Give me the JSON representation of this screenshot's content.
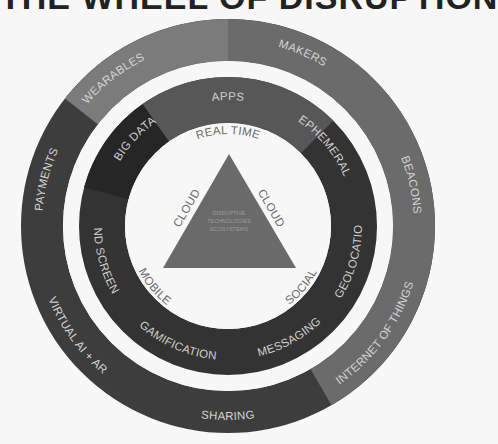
{
  "title": "THE WHEEL OF DISRUPTION",
  "colors": {
    "background": "#f7f7f7",
    "outer_light": "#7b7b7b",
    "outer_medium": "#6b6b6b",
    "outer_dark": "#3d3d3d",
    "inner_dark": "#333333",
    "inner_darker": "#262626",
    "inner_light": "#575757",
    "triangle": "#6a6a6a",
    "label_text": "#d4d4d4",
    "center_text": "#6a6a6a"
  },
  "outer_ring": {
    "segments": [
      {
        "label": "WEARABLES",
        "color": "#7b7b7b"
      },
      {
        "label": "MAKERS",
        "color": "#6b6b6b"
      },
      {
        "label": "BEACONS",
        "color": "#6b6b6b"
      },
      {
        "label": "INTERNET OF THINGS",
        "color": "#686868"
      },
      {
        "label": "SHARING",
        "color": "#3d3d3d"
      },
      {
        "label": "VIRTUAL AI + AR",
        "color": "#3d3d3d"
      },
      {
        "label": "PAYMENTS",
        "color": "#3d3d3d"
      }
    ]
  },
  "inner_ring": {
    "segments": [
      {
        "label": "APPS",
        "color": "#575757"
      },
      {
        "label": "EPHEMERAL",
        "color": "#333333"
      },
      {
        "label": "GEOLOCATION",
        "color": "#333333"
      },
      {
        "label": "MESSAGING",
        "color": "#333333"
      },
      {
        "label": "GAMIFICATION",
        "color": "#333333"
      },
      {
        "label": "2ND SCREEN",
        "color": "#2b2b2b"
      },
      {
        "label": "BIG DATA",
        "color": "#262626"
      }
    ]
  },
  "center_circle": {
    "labels": {
      "top": "REAL TIME",
      "left": "MOBILE",
      "right": "SOCIAL"
    }
  },
  "triangle": {
    "side_left": "CLOUD",
    "side_right": "CLOUD",
    "center_lines": [
      "DISRUPTIVE",
      "TECHNOLOGIES",
      "ECOSYSTEMS"
    ]
  }
}
